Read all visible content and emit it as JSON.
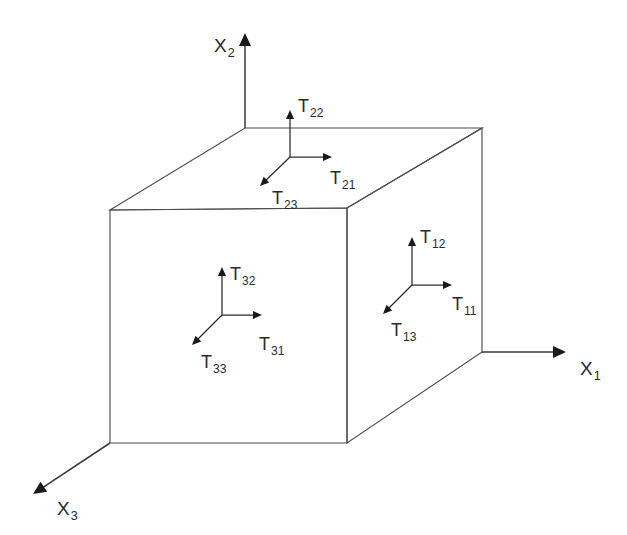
{
  "diagram": {
    "background_color": "#ffffff",
    "line_color": "#4d4d4d",
    "arrow_color": "#1a1a1a",
    "text_color": "#2a2a2a"
  },
  "axes": [
    {
      "id": "x1",
      "symbol": "X",
      "subscript": "1",
      "label": "X1",
      "direction": "right",
      "origin": [
        482,
        352
      ],
      "tip": [
        566,
        352
      ],
      "label_pos": [
        580,
        375
      ]
    },
    {
      "id": "x2",
      "symbol": "X",
      "subscript": "2",
      "label": "X2",
      "direction": "up",
      "origin": [
        245,
        128
      ],
      "tip": [
        245,
        33
      ],
      "label_pos": [
        214,
        52
      ]
    },
    {
      "id": "x3",
      "symbol": "X",
      "subscript": "3",
      "label": "X3",
      "direction": "down-left",
      "origin": [
        110,
        443
      ],
      "tip": [
        33,
        494
      ],
      "label_pos": [
        57,
        515
      ]
    }
  ],
  "cube": {
    "front_face": {
      "name": "front-face",
      "corners": [
        [
          110,
          210
        ],
        [
          347,
          208
        ],
        [
          347,
          443
        ],
        [
          110,
          443
        ]
      ]
    },
    "top_face": {
      "name": "top-face",
      "corners": [
        [
          110,
          210
        ],
        [
          245,
          128
        ],
        [
          482,
          128
        ],
        [
          347,
          208
        ]
      ]
    },
    "right_face": {
      "name": "right-face",
      "corners": [
        [
          347,
          208
        ],
        [
          482,
          128
        ],
        [
          482,
          352
        ],
        [
          347,
          443
        ]
      ]
    }
  },
  "stress_triads": [
    {
      "id": "front",
      "face": "front-face",
      "origin": [
        222,
        315
      ],
      "arrows": [
        {
          "id": "t32",
          "symbol": "T",
          "subscript": "32",
          "label": "T32",
          "component": "normal-up",
          "tip": [
            222,
            267
          ],
          "label_pos": [
            230,
            280
          ]
        },
        {
          "id": "t31",
          "symbol": "T",
          "subscript": "31",
          "label": "T31",
          "component": "shear-right",
          "tip": [
            262,
            315
          ],
          "label_pos": [
            259,
            350
          ]
        },
        {
          "id": "t33",
          "symbol": "T",
          "subscript": "33",
          "label": "T33",
          "component": "shear-down-left",
          "tip": [
            192,
            345
          ],
          "label_pos": [
            201,
            368
          ]
        }
      ]
    },
    {
      "id": "top",
      "face": "top-face",
      "origin": [
        290,
        157
      ],
      "arrows": [
        {
          "id": "t22",
          "symbol": "T",
          "subscript": "22",
          "label": "T22",
          "component": "normal-up",
          "tip": [
            290,
            110
          ],
          "label_pos": [
            298,
            112
          ]
        },
        {
          "id": "t21",
          "symbol": "T",
          "subscript": "21",
          "label": "T21",
          "component": "shear-right",
          "tip": [
            332,
            157
          ],
          "label_pos": [
            330,
            184
          ]
        },
        {
          "id": "t23",
          "symbol": "T",
          "subscript": "23",
          "label": "T23",
          "component": "shear-down-left",
          "tip": [
            260,
            186
          ],
          "label_pos": [
            272,
            204
          ]
        }
      ]
    },
    {
      "id": "right",
      "face": "right-face",
      "origin": [
        412,
        285
      ],
      "arrows": [
        {
          "id": "t12",
          "symbol": "T",
          "subscript": "12",
          "label": "T12",
          "component": "normal-up",
          "tip": [
            412,
            237
          ],
          "label_pos": [
            420,
            243
          ]
        },
        {
          "id": "t11",
          "symbol": "T",
          "subscript": "11",
          "label": "T11",
          "component": "shear-right",
          "tip": [
            452,
            285
          ],
          "label_pos": [
            452,
            310
          ]
        },
        {
          "id": "t13",
          "symbol": "T",
          "subscript": "13",
          "label": "T13",
          "component": "shear-down-left",
          "tip": [
            383,
            314
          ],
          "label_pos": [
            391,
            336
          ]
        }
      ]
    }
  ]
}
